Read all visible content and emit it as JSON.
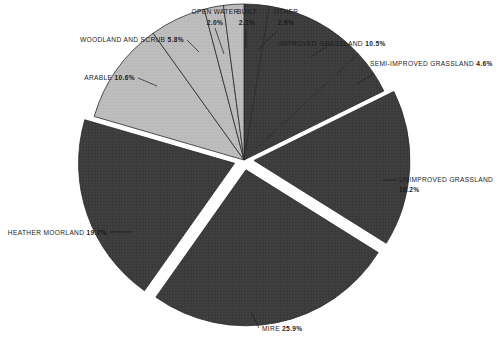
{
  "chart_data": {
    "type": "pie",
    "title": "",
    "subtitle": "",
    "xlabel": "",
    "ylabel": "",
    "legend_position": "none",
    "grid": false,
    "units": "percent",
    "total": 100.0,
    "categories": [
      "OTHER",
      "IMPROVED GRASSLAND",
      "SEMI-IMPROVED GRASSLAND",
      "UNIMPROVED GRASSLAND",
      "MIRE",
      "HEATHER MOORLAND",
      "ARABLE",
      "WOODLAND AND SCRUB",
      "OPEN WATER",
      "BUILT"
    ],
    "values": [
      2.6,
      10.5,
      4.6,
      16.2,
      25.9,
      19.7,
      10.6,
      5.8,
      2.0,
      2.1
    ],
    "slices": [
      {
        "label": "OTHER",
        "value": 2.6,
        "value_text": "2.6%",
        "fill": "dark",
        "exploded": false
      },
      {
        "label": "IMPROVED GRASSLAND",
        "value": 10.5,
        "value_text": "10.5%",
        "fill": "dark",
        "exploded": false
      },
      {
        "label": "SEMI-IMPROVED GRASSLAND",
        "value": 4.6,
        "value_text": "4.6%",
        "fill": "dark",
        "exploded": false
      },
      {
        "label": "UNIMPROVED GRASSLAND",
        "value": 16.2,
        "value_text": "16.2%",
        "fill": "dark",
        "exploded": true
      },
      {
        "label": "MIRE",
        "value": 25.9,
        "value_text": "25.9%",
        "fill": "dark",
        "exploded": true
      },
      {
        "label": "HEATHER MOORLAND",
        "value": 19.7,
        "value_text": "19.7%",
        "fill": "dark",
        "exploded": true
      },
      {
        "label": "ARABLE",
        "value": 10.6,
        "value_text": "10.6%",
        "fill": "light",
        "exploded": false
      },
      {
        "label": "WOODLAND AND SCRUB",
        "value": 5.8,
        "value_text": "5.8%",
        "fill": "light",
        "exploded": false
      },
      {
        "label": "OPEN WATER",
        "value": 2.0,
        "value_text": "2.0%",
        "fill": "light",
        "exploded": false
      },
      {
        "label": "BUILT",
        "value": 2.1,
        "value_text": "2.1%",
        "fill": "light",
        "exploded": false
      }
    ],
    "colors": {
      "dark_slice": "#3d3d3d",
      "light_slice": "#b9b9b9",
      "slice_outline": "#2a2a2a",
      "label_text": "#1b1b1b",
      "background": "#ffffff"
    }
  },
  "labels": {
    "other": {
      "name": "OTHER",
      "pct": "2.6%"
    },
    "improved_grassland": {
      "name": "IMPROVED GRASSLAND",
      "pct": "10.5%"
    },
    "semi_improved_grassland": {
      "name": "SEMI-IMPROVED GRASSLAND",
      "pct": "4.6%"
    },
    "unimproved_grassland": {
      "name": "UNIMPROVED GRASSLAND",
      "pct": "16.2%"
    },
    "mire": {
      "name": "MIRE",
      "pct": "25.9%"
    },
    "heather_moorland": {
      "name": "HEATHER MOORLAND",
      "pct": "19.7%"
    },
    "arable": {
      "name": "ARABLE",
      "pct": "10.6%"
    },
    "woodland_and_scrub": {
      "name": "WOODLAND AND SCRUB",
      "pct": "5.8%"
    },
    "open_water": {
      "name": "OPEN WATER",
      "pct": "2.0%"
    },
    "built": {
      "name": "BUILT",
      "pct": "2.1%"
    }
  }
}
